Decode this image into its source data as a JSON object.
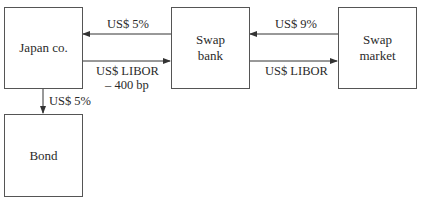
{
  "nodes": {
    "japan": {
      "label": "Japan co."
    },
    "bank": {
      "line1": "Swap",
      "line2": "bank"
    },
    "market": {
      "line1": "Swap",
      "line2": "market"
    },
    "bond": {
      "label": "Bond"
    }
  },
  "flows": {
    "bank_to_japan": "US$ 5%",
    "japan_to_bank_1": "US$ LIBOR",
    "japan_to_bank_2": "– 400 bp",
    "market_to_bank": "US$ 9%",
    "bank_to_market": "US$ LIBOR",
    "japan_to_bond": "US$ 5%"
  },
  "colors": {
    "line": "#333333",
    "border": "#555555"
  }
}
